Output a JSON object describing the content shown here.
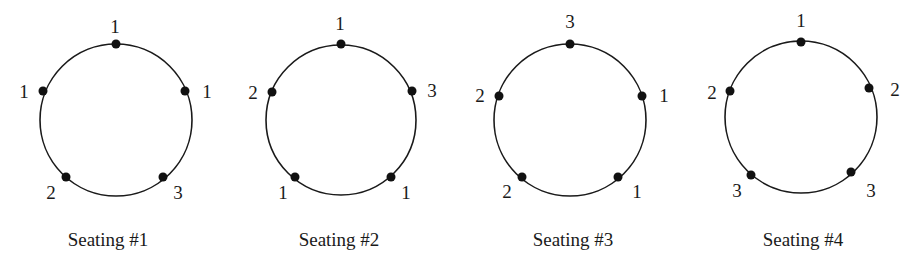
{
  "figure": {
    "seatings": [
      {
        "caption": "Seating #1",
        "seats": {
          "top": "1",
          "upper_right": "1",
          "lower_right": "3",
          "lower_left": "2",
          "upper_left": "1"
        }
      },
      {
        "caption": "Seating #2",
        "seats": {
          "top": "1",
          "upper_right": "3",
          "lower_right": "1",
          "lower_left": "1",
          "upper_left": "2"
        }
      },
      {
        "caption": "Seating #3",
        "seats": {
          "top": "3",
          "upper_right": "1",
          "lower_right": "1",
          "lower_left": "2",
          "upper_left": "2"
        }
      },
      {
        "caption": "Seating #4",
        "seats": {
          "top": "1",
          "upper_right": "2",
          "lower_right": "3",
          "lower_left": "3",
          "upper_left": "2"
        }
      }
    ],
    "colors": {
      "stroke": "#1a1a1a",
      "dot": "#111111",
      "background": "#ffffff"
    }
  }
}
